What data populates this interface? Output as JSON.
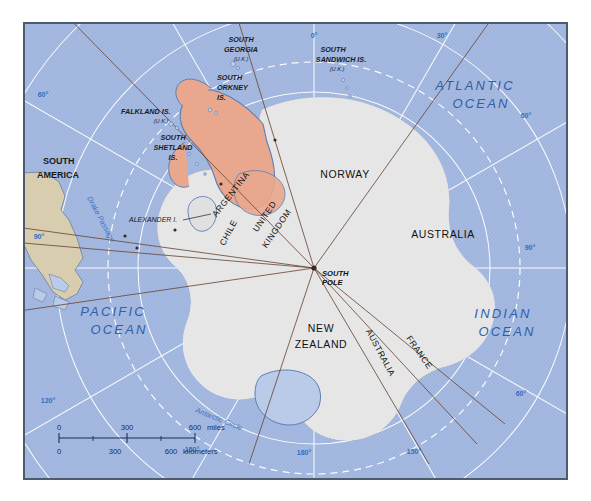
{
  "map": {
    "title": "Antarctica Territorial Claims",
    "pole_label": "SOUTH\nPOLE",
    "pole_label_line1": "SOUTH",
    "pole_label_line2": "POLE"
  },
  "oceans": [
    {
      "name": "atlantic",
      "label_line1": "ATLANTIC",
      "label_line2": "OCEAN"
    },
    {
      "name": "indian",
      "label_line1": "INDIAN",
      "label_line2": "OCEAN"
    },
    {
      "name": "pacific",
      "label_line1": "PACIFIC",
      "label_line2": "OCEAN"
    }
  ],
  "claims": [
    {
      "key": "norway",
      "label": "NORWAY",
      "color": "#a8c47e"
    },
    {
      "key": "australia_main",
      "label": "AUSTRALIA",
      "color": "#c3addb"
    },
    {
      "key": "australia_second",
      "label": "AUSTRALIA",
      "color": "#c3addb"
    },
    {
      "key": "france",
      "label": "FRANCE",
      "color": "#4e8c3f"
    },
    {
      "key": "new_zealand",
      "label_line1": "NEW",
      "label_line2": "ZEALAND",
      "color": "#f2dfa8"
    },
    {
      "key": "argentina",
      "label": "ARGENTINA",
      "color": "#e9a78e"
    },
    {
      "key": "chile",
      "label": "CHILE",
      "color": "#f0dd76"
    },
    {
      "key": "united_kingdom",
      "label_line1": "UNITED",
      "label_line2": "KINGDOM",
      "color": "#e9a78e"
    },
    {
      "key": "unclaimed",
      "label": "",
      "color": "#dcdcdc"
    }
  ],
  "islands": [
    {
      "name": "south-georgia",
      "label_line1": "SOUTH",
      "label_line2": "GEORGIA",
      "sub": "(U.K.)"
    },
    {
      "name": "south-sandwich",
      "label_line1": "SOUTH",
      "label_line2": "SANDWICH IS.",
      "sub": "(U.K.)"
    },
    {
      "name": "south-orkney",
      "label_line1": "SOUTH",
      "label_line2": "ORKNEY",
      "label_line3": "IS."
    },
    {
      "name": "falkland",
      "label": "FALKLAND IS.",
      "sub": "(U.K.)"
    },
    {
      "name": "south-shetland",
      "label_line1": "SOUTH",
      "label_line2": "SHETLAND",
      "label_line3": "IS."
    }
  ],
  "landmasses": [
    {
      "name": "south-america",
      "label_line1": "SOUTH",
      "label_line2": "AMERICA"
    }
  ],
  "features": [
    {
      "name": "drake-passage",
      "label": "Drake Passage"
    },
    {
      "name": "antarctic-circle",
      "label": "Antarctic Circle"
    },
    {
      "name": "alexander-island",
      "label": "ALEXANDER I."
    }
  ],
  "graticule": {
    "longitudes": [
      {
        "label": "0°",
        "x": 312,
        "y": 14
      },
      {
        "label": "30°",
        "x": 440,
        "y": 14
      },
      {
        "label": "60°",
        "x": 524,
        "y": 94
      },
      {
        "label": "90°",
        "x": 528,
        "y": 226
      },
      {
        "label": "60°",
        "x": 519,
        "y": 390
      },
      {
        "label": "150°",
        "x": 412,
        "y": 442
      },
      {
        "label": "180°",
        "x": 302,
        "y": 443
      },
      {
        "label": "150°",
        "x": 190,
        "y": 440
      },
      {
        "label": "120°",
        "x": 46,
        "y": 391
      },
      {
        "label": "90°",
        "x": 12,
        "y": 227
      },
      {
        "label": "60°",
        "x": 28,
        "y": 85
      }
    ]
  },
  "scale": {
    "miles_unit": "miles",
    "kilometers_unit": "kilometers",
    "miles_ticks": [
      "0",
      "300",
      "600"
    ],
    "km_ticks": [
      "0",
      "300",
      "600"
    ]
  }
}
